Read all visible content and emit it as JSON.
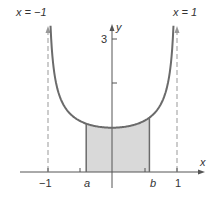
{
  "diagram": {
    "asymptote_left_label": "x = −1",
    "asymptote_right_label": "x = 1",
    "x_axis_label": "x",
    "y_axis_label": "y",
    "y_tick_label": "3",
    "x_tick_labels": {
      "neg_one": "−1",
      "a": "a",
      "b": "b",
      "one": "1"
    },
    "colors": {
      "curve": "#6b6b6b",
      "shade": "#d9d9d9",
      "axis": "#555555",
      "asymptote": "#999999"
    }
  },
  "chart_data": {
    "type": "line",
    "title": "",
    "function": "y = 1/sqrt(1 - x^2)",
    "xlabel": "x",
    "ylabel": "y",
    "x_ticks": [
      "−1",
      "a",
      "b",
      "1"
    ],
    "y_ticks": [
      "3"
    ],
    "asymptotes": [
      -1,
      1
    ],
    "shaded_interval": {
      "a": -0.4,
      "b": 0.58
    },
    "minimum": {
      "x": 0,
      "y": 1
    },
    "xlim": [
      -1.5,
      1.5
    ],
    "ylim": [
      0,
      3.3
    ]
  }
}
